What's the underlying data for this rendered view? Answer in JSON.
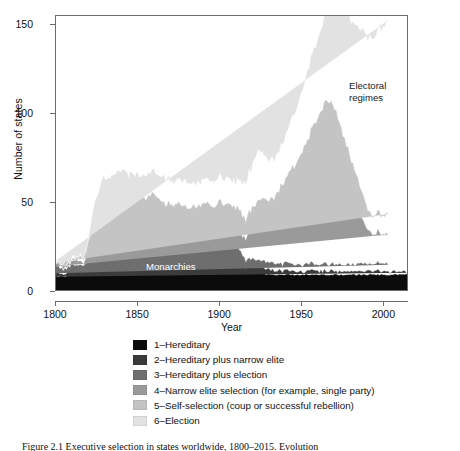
{
  "chart_data": {
    "type": "area",
    "stacked": true,
    "title": "",
    "xlabel": "Year",
    "ylabel": "Number of states",
    "xlim": [
      1800,
      2015
    ],
    "ylim": [
      0,
      155
    ],
    "xticks": [
      1800,
      1850,
      1900,
      1950,
      2000
    ],
    "yticks": [
      0,
      50,
      100,
      150
    ],
    "grid": false,
    "legend_position": "below-plot",
    "annotations": [
      {
        "text": "Electoral\nregimes",
        "x": 1985,
        "y": 112,
        "color": "#1a1a1a"
      },
      {
        "text": "Monarchies",
        "x": 1857,
        "y": 9,
        "color": "#ffffff"
      }
    ],
    "series": [
      {
        "name": "1-Hereditary",
        "color": "#0b0b0b",
        "values": [
          8,
          8,
          8,
          8,
          8,
          8,
          8,
          8,
          9,
          9,
          9,
          9,
          9,
          9,
          9,
          9,
          9,
          9,
          10,
          10,
          12,
          13,
          14,
          15,
          16,
          16,
          17,
          17,
          17,
          17,
          18,
          18,
          18,
          18,
          18,
          18,
          19,
          19,
          19,
          19,
          19,
          19,
          19,
          19,
          19,
          19,
          19,
          19,
          19,
          19,
          19,
          19,
          19,
          19,
          19,
          19,
          19,
          19,
          19,
          19,
          19,
          19,
          19,
          19,
          18,
          18,
          18,
          18,
          18,
          17,
          17,
          17,
          17,
          17,
          17,
          17,
          17,
          17,
          17,
          16,
          16,
          16,
          16,
          16,
          16,
          16,
          16,
          16,
          16,
          16,
          16,
          16,
          16,
          16,
          16,
          16,
          16,
          16,
          16,
          16,
          16,
          16,
          16,
          16,
          16,
          15,
          15,
          15,
          15,
          15,
          14,
          13,
          12,
          11,
          10,
          10,
          10,
          10,
          10,
          10,
          10,
          10,
          10,
          10,
          10,
          10,
          9,
          9,
          9,
          9,
          9,
          9,
          9,
          9,
          9,
          9,
          9,
          9,
          9,
          9,
          9,
          9,
          9,
          9,
          9,
          9,
          9,
          9,
          9,
          9,
          9,
          9,
          9,
          9,
          9,
          9,
          9,
          9,
          9,
          9,
          9,
          9,
          9,
          9,
          9,
          9,
          9,
          9,
          9,
          9,
          9,
          9,
          9,
          9,
          9,
          9,
          9,
          9,
          9,
          9,
          9,
          9,
          9,
          9,
          9,
          9,
          9,
          9,
          9,
          9,
          9,
          9,
          9,
          9,
          9,
          9,
          9,
          9,
          9,
          9,
          9,
          9,
          9,
          9,
          9,
          9,
          9,
          9,
          9,
          9,
          9,
          9
        ]
      },
      {
        "name": "2-Hereditary plus narrow elite",
        "color": "#3b3b3b",
        "values": [
          2,
          2,
          2,
          2,
          2,
          2,
          2,
          2,
          2,
          2,
          2,
          2,
          2,
          2,
          2,
          2,
          2,
          2,
          2,
          2,
          3,
          3,
          4,
          4,
          5,
          5,
          6,
          6,
          6,
          6,
          6,
          6,
          6,
          6,
          6,
          6,
          6,
          6,
          6,
          6,
          6,
          6,
          6,
          6,
          6,
          6,
          6,
          6,
          6,
          6,
          6,
          6,
          6,
          6,
          6,
          6,
          6,
          6,
          6,
          6,
          6,
          6,
          6,
          6,
          5,
          5,
          5,
          5,
          5,
          5,
          5,
          5,
          5,
          5,
          5,
          5,
          5,
          5,
          5,
          5,
          5,
          5,
          5,
          5,
          5,
          5,
          5,
          5,
          5,
          5,
          5,
          5,
          5,
          5,
          5,
          5,
          5,
          5,
          5,
          5,
          5,
          5,
          5,
          5,
          5,
          4,
          4,
          4,
          4,
          4,
          4,
          4,
          3,
          3,
          3,
          3,
          3,
          3,
          3,
          3,
          3,
          3,
          3,
          3,
          3,
          3,
          3,
          3,
          3,
          3,
          3,
          2,
          2,
          2,
          2,
          2,
          2,
          2,
          2,
          2,
          2,
          2,
          2,
          2,
          2,
          2,
          2,
          2,
          2,
          2,
          2,
          2,
          2,
          2,
          2,
          2,
          2,
          2,
          2,
          2,
          2,
          2,
          2,
          2,
          2,
          2,
          2,
          2,
          2,
          2,
          2,
          2,
          2,
          2,
          2,
          2,
          2,
          2,
          2,
          2,
          2,
          2,
          2,
          2,
          2,
          2,
          2,
          2,
          2,
          2,
          2,
          2,
          2,
          2,
          2,
          2,
          2,
          2,
          2,
          2,
          2,
          2,
          2,
          2,
          2,
          2,
          2,
          2,
          2,
          2,
          2
        ]
      },
      {
        "name": "3-Hereditary plus election",
        "color": "#6e6e6e",
        "values": [
          3,
          3,
          3,
          3,
          3,
          3,
          3,
          3,
          3,
          3,
          3,
          3,
          3,
          3,
          3,
          3,
          3,
          3,
          3,
          3,
          4,
          4,
          5,
          5,
          6,
          6,
          7,
          7,
          7,
          8,
          8,
          8,
          8,
          8,
          8,
          8,
          8,
          8,
          8,
          8,
          8,
          8,
          8,
          8,
          8,
          8,
          8,
          8,
          8,
          8,
          8,
          8,
          8,
          8,
          8,
          8,
          8,
          8,
          8,
          8,
          8,
          8,
          8,
          8,
          7,
          7,
          7,
          7,
          7,
          7,
          7,
          7,
          7,
          7,
          7,
          7,
          7,
          7,
          7,
          7,
          7,
          7,
          7,
          7,
          7,
          7,
          7,
          7,
          7,
          7,
          7,
          7,
          7,
          7,
          7,
          7,
          7,
          7,
          7,
          7,
          7,
          7,
          7,
          7,
          6,
          6,
          6,
          6,
          6,
          5,
          5,
          5,
          4,
          4,
          4,
          4,
          4,
          4,
          4,
          4,
          4,
          4,
          4,
          4,
          4,
          4,
          4,
          4,
          4,
          4,
          4,
          4,
          4,
          4,
          4,
          4,
          4,
          4,
          4,
          4,
          4,
          4,
          4,
          4,
          4,
          4,
          4,
          4,
          4,
          4,
          4,
          4,
          4,
          4,
          4,
          4,
          4,
          4,
          4,
          4,
          4,
          4,
          4,
          4,
          4,
          4,
          4,
          4,
          4,
          4,
          4,
          4,
          4,
          4,
          4,
          4,
          4,
          4,
          4,
          4,
          4,
          4,
          4,
          4,
          4,
          4,
          4,
          4,
          4,
          4,
          4,
          4,
          4,
          4,
          4,
          4,
          4,
          4,
          4,
          4
        ]
      },
      {
        "name": "4-Narrow elite selection (for example, single party)",
        "color": "#9a9a9a",
        "values": [
          2,
          2,
          2,
          2,
          2,
          2,
          2,
          2,
          2,
          2,
          2,
          2,
          2,
          2,
          2,
          2,
          2,
          2,
          3,
          3,
          4,
          5,
          6,
          7,
          8,
          8,
          9,
          9,
          9,
          9,
          9,
          9,
          9,
          9,
          9,
          9,
          9,
          9,
          9,
          9,
          9,
          9,
          9,
          9,
          9,
          9,
          9,
          9,
          9,
          9,
          9,
          9,
          9,
          9,
          9,
          9,
          9,
          9,
          9,
          9,
          9,
          9,
          9,
          9,
          9,
          9,
          9,
          9,
          9,
          9,
          9,
          9,
          9,
          9,
          9,
          9,
          9,
          9,
          9,
          9,
          9,
          9,
          9,
          9,
          9,
          9,
          9,
          9,
          9,
          9,
          9,
          9,
          9,
          9,
          9,
          9,
          9,
          9,
          10,
          10,
          10,
          10,
          10,
          10,
          11,
          11,
          11,
          11,
          11,
          11,
          11,
          11,
          11,
          12,
          13,
          14,
          15,
          16,
          17,
          18,
          19,
          20,
          21,
          22,
          22,
          22,
          22,
          22,
          22,
          23,
          24,
          25,
          26,
          27,
          28,
          29,
          30,
          31,
          32,
          33,
          34,
          35,
          36,
          37,
          38,
          39,
          40,
          41,
          42,
          43,
          44,
          45,
          46,
          47,
          48,
          49,
          50,
          51,
          52,
          53,
          54,
          55,
          56,
          57,
          58,
          58,
          57,
          56,
          55,
          54,
          52,
          50,
          48,
          46,
          44,
          42,
          40,
          38,
          36,
          34,
          32,
          30,
          28,
          26,
          24,
          22,
          21,
          20,
          19,
          18,
          17,
          17,
          17,
          17,
          17,
          17,
          17,
          17,
          17,
          17,
          17,
          17,
          17,
          17
        ]
      },
      {
        "name": "5-Self-selection (coup or successful rebellion)",
        "color": "#c4c4c4",
        "values": [
          1,
          1,
          1,
          1,
          1,
          1,
          1,
          1,
          1,
          1,
          1,
          1,
          1,
          1,
          1,
          2,
          2,
          2,
          3,
          4,
          5,
          6,
          7,
          8,
          9,
          10,
          10,
          10,
          10,
          10,
          10,
          10,
          10,
          10,
          10,
          11,
          11,
          11,
          11,
          11,
          11,
          11,
          11,
          11,
          11,
          11,
          11,
          11,
          11,
          11,
          11,
          11,
          11,
          11,
          11,
          11,
          11,
          11,
          11,
          11,
          11,
          11,
          11,
          11,
          11,
          11,
          11,
          11,
          11,
          11,
          11,
          11,
          11,
          11,
          11,
          11,
          11,
          11,
          11,
          11,
          11,
          11,
          11,
          11,
          11,
          11,
          11,
          11,
          11,
          11,
          11,
          11,
          11,
          11,
          11,
          11,
          11,
          11,
          11,
          11,
          11,
          11,
          11,
          11,
          11,
          11,
          11,
          11,
          11,
          11,
          11,
          11,
          11,
          11,
          11,
          11,
          12,
          12,
          12,
          12,
          12,
          12,
          12,
          12,
          12,
          12,
          12,
          12,
          12,
          12,
          12,
          12,
          12,
          13,
          13,
          14,
          15,
          15,
          16,
          16,
          17,
          17,
          18,
          18,
          19,
          19,
          20,
          21,
          22,
          23,
          24,
          25,
          26,
          27,
          28,
          29,
          30,
          31,
          32,
          33,
          34,
          35,
          36,
          35,
          34,
          33,
          32,
          31,
          30,
          29,
          28,
          27,
          26,
          25,
          24,
          23,
          22,
          21,
          20,
          19,
          18,
          17,
          16,
          15,
          14,
          13,
          12,
          11,
          11,
          11,
          11,
          11,
          11,
          11,
          11,
          11,
          11,
          11,
          11,
          11,
          11
        ]
      },
      {
        "name": "6-Election",
        "color": "#e2e2e2",
        "values": [
          1,
          1,
          1,
          1,
          1,
          1,
          1,
          1,
          1,
          1,
          1,
          1,
          1,
          1,
          1,
          1,
          1,
          1,
          2,
          2,
          3,
          4,
          5,
          6,
          7,
          8,
          9,
          10,
          11,
          12,
          12,
          12,
          12,
          12,
          12,
          12,
          13,
          13,
          13,
          13,
          13,
          13,
          13,
          13,
          13,
          13,
          13,
          13,
          13,
          13,
          13,
          13,
          13,
          13,
          13,
          13,
          13,
          13,
          13,
          13,
          13,
          13,
          13,
          13,
          14,
          14,
          14,
          14,
          14,
          14,
          14,
          14,
          14,
          14,
          14,
          14,
          14,
          14,
          14,
          14,
          14,
          14,
          14,
          14,
          14,
          14,
          14,
          14,
          14,
          14,
          14,
          14,
          14,
          14,
          14,
          14,
          14,
          14,
          14,
          14,
          14,
          14,
          15,
          15,
          15,
          15,
          15,
          15,
          15,
          16,
          17,
          18,
          19,
          20,
          21,
          22,
          23,
          24,
          25,
          26,
          27,
          28,
          28,
          27,
          26,
          25,
          24,
          23,
          23,
          23,
          23,
          23,
          23,
          23,
          23,
          23,
          23,
          24,
          25,
          26,
          27,
          28,
          29,
          30,
          31,
          32,
          33,
          34,
          35,
          36,
          37,
          38,
          39,
          40,
          41,
          42,
          43,
          44,
          45,
          46,
          47,
          48,
          49,
          50,
          52,
          54,
          56,
          58,
          60,
          62,
          64,
          66,
          68,
          70,
          72,
          74,
          76,
          78,
          80,
          82,
          84,
          86,
          88,
          90,
          92,
          94,
          96,
          97,
          98,
          99,
          100,
          101,
          102,
          103,
          104,
          105,
          106,
          107,
          108,
          108,
          108,
          108
        ]
      }
    ]
  },
  "axes": {
    "ylabel": "Number of states",
    "xlabel": "Year",
    "yticks": [
      "150",
      "100",
      "50",
      "0"
    ],
    "xticks": [
      "1800",
      "1850",
      "1900",
      "1950",
      "2000"
    ]
  },
  "annotations": {
    "electoral": "Electoral\nregimes",
    "monarchies": "Monarchies"
  },
  "legend": {
    "items": [
      {
        "label": "1–Hereditary",
        "color": "#0b0b0b"
      },
      {
        "label": "2–Hereditary plus narrow elite",
        "color": "#3b3b3b"
      },
      {
        "label": "3–Hereditary plus election",
        "color": "#6e6e6e"
      },
      {
        "label": "4–Narrow elite selection (for example, single party)",
        "color": "#9a9a9a"
      },
      {
        "label": "5–Self-selection (coup or successful rebellion)",
        "color": "#c4c4c4"
      },
      {
        "label": "6–Election",
        "color": "#e2e2e2"
      }
    ]
  },
  "caption": {
    "text": "Figure 2.1  Executive selection in states worldwide, 1800–2015. Evolution"
  }
}
